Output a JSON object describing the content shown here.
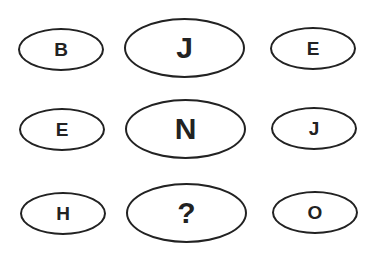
{
  "puzzle": {
    "rows": [
      {
        "left": "B",
        "center": "J",
        "right": "E"
      },
      {
        "left": "E",
        "center": "N",
        "right": "J"
      },
      {
        "left": "H",
        "center": "?",
        "right": "O"
      }
    ]
  }
}
